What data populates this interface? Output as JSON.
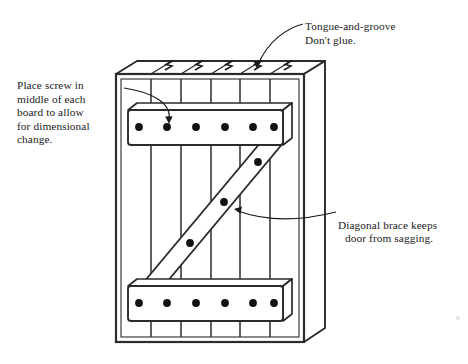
{
  "figure": {
    "annotations": {
      "screw_note": "Place screw in\nmiddle of each\nboard to allow\nfor dimensional\nchange.",
      "tongue_note": "Tongue-and-groove\nDon't glue.",
      "brace_note_line1": "Diagonal brace keeps",
      "brace_note_line2": "door from sagging."
    },
    "parts": {
      "door_panel": "door-panel",
      "top_batten": "top-batten",
      "bottom_batten": "bottom-batten",
      "diagonal_brace": "diagonal-brace",
      "board_count": 6,
      "tongue_groove_joints": 5,
      "top_batten_screws": 6,
      "bottom_batten_screws": 6,
      "diagonal_brace_screws": 4
    },
    "colors": {
      "ink": "#1a1a1a",
      "line": "#2b2b2b",
      "paper": "#ffffff",
      "screw": "#111111"
    },
    "edge_artifact": "s"
  }
}
